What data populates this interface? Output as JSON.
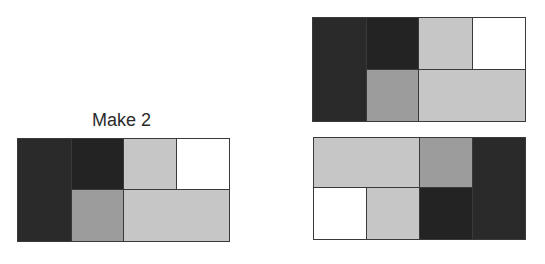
{
  "label": "Make 2",
  "colors": {
    "black": "#2a2a2a",
    "dark": "#232323",
    "medium": "#9c9c9c",
    "light": "#c6c6c6",
    "white": "#ffffff",
    "border": "#3a3a3a"
  },
  "figures": [
    {
      "name": "original-rectangle",
      "pieces": [
        {
          "shade": "black",
          "x": 0,
          "y": 0,
          "w": 54,
          "h": 103
        },
        {
          "shade": "dark",
          "x": 54,
          "y": 0,
          "w": 52,
          "h": 51
        },
        {
          "shade": "light",
          "x": 106,
          "y": 0,
          "w": 53,
          "h": 51
        },
        {
          "shade": "white",
          "x": 159,
          "y": 0,
          "w": 53,
          "h": 51
        },
        {
          "shade": "medium",
          "x": 54,
          "y": 51,
          "w": 52,
          "h": 52
        },
        {
          "shade": "light",
          "x": 106,
          "y": 51,
          "w": 106,
          "h": 52
        }
      ]
    },
    {
      "name": "copy-top",
      "pieces": [
        {
          "shade": "black",
          "x": 0,
          "y": 0,
          "w": 54,
          "h": 104
        },
        {
          "shade": "dark",
          "x": 54,
          "y": 0,
          "w": 52,
          "h": 52
        },
        {
          "shade": "light",
          "x": 106,
          "y": 0,
          "w": 54,
          "h": 52
        },
        {
          "shade": "white",
          "x": 160,
          "y": 0,
          "w": 53,
          "h": 52
        },
        {
          "shade": "medium",
          "x": 54,
          "y": 52,
          "w": 52,
          "h": 52
        },
        {
          "shade": "light",
          "x": 106,
          "y": 52,
          "w": 107,
          "h": 52
        }
      ]
    },
    {
      "name": "copy-bottom",
      "pieces": [
        {
          "shade": "light",
          "x": 0,
          "y": 0,
          "w": 106,
          "h": 50
        },
        {
          "shade": "medium",
          "x": 106,
          "y": 0,
          "w": 53,
          "h": 50
        },
        {
          "shade": "black",
          "x": 159,
          "y": 0,
          "w": 53,
          "h": 102
        },
        {
          "shade": "white",
          "x": 0,
          "y": 50,
          "w": 53,
          "h": 52
        },
        {
          "shade": "light",
          "x": 53,
          "y": 50,
          "w": 53,
          "h": 52
        },
        {
          "shade": "dark",
          "x": 106,
          "y": 50,
          "w": 53,
          "h": 52
        }
      ]
    }
  ],
  "layout": [
    {
      "left": 17,
      "top": 138,
      "width": 212,
      "height": 103
    },
    {
      "left": 312,
      "top": 17,
      "width": 213,
      "height": 104
    },
    {
      "left": 313,
      "top": 137,
      "width": 212,
      "height": 102
    }
  ]
}
